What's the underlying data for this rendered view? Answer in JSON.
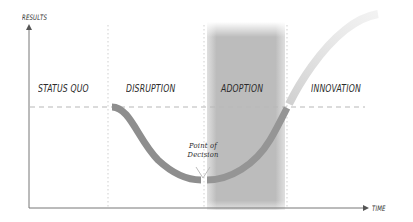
{
  "diagram": {
    "type": "change-curve",
    "axes": {
      "y_label": "RESULTS",
      "x_label": "TIME"
    },
    "phases": [
      {
        "label": "STATUS QUO"
      },
      {
        "label": "DISRUPTION"
      },
      {
        "label": "ADOPTION"
      },
      {
        "label": "INNOVATION"
      }
    ],
    "annotation": {
      "line1": "Point of",
      "line2": "Decision"
    },
    "colors": {
      "curve": "#8a8a8a",
      "curve_light": "#d4d4d4",
      "adoption_band": "#bdbdbd",
      "axis": "#777777",
      "baseline": "#b8b8b8"
    }
  }
}
